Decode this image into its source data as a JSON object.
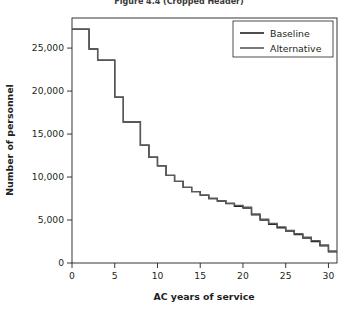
{
  "figure": {
    "title": "Figure 4.4 (Cropped Header)"
  },
  "chart_data": {
    "type": "line",
    "subtype": "step",
    "title": "",
    "xlabel": "AC years of service",
    "ylabel": "Number of personnel",
    "xlim": [
      0,
      31
    ],
    "ylim": [
      0,
      28500
    ],
    "xticks": [
      0,
      5,
      10,
      15,
      20,
      25,
      30
    ],
    "xticklabels": [
      "0",
      "5",
      "10",
      "15",
      "20",
      "25",
      "30"
    ],
    "yticks": [
      0,
      5000,
      10000,
      15000,
      20000,
      25000
    ],
    "yticklabels": [
      "0",
      "5,000",
      "10,000",
      "15,000",
      "20,000",
      "25,000"
    ],
    "grid": false,
    "legend_position": "top-right",
    "x": [
      0,
      1,
      2,
      3,
      4,
      5,
      6,
      7,
      8,
      9,
      10,
      11,
      12,
      13,
      14,
      15,
      16,
      17,
      18,
      19,
      20,
      21,
      22,
      23,
      24,
      25,
      26,
      27,
      28,
      29,
      30
    ],
    "series": [
      {
        "name": "Baseline",
        "color": "#231f20",
        "values": [
          27200,
          27200,
          24900,
          23600,
          23600,
          19300,
          16400,
          16400,
          13700,
          12300,
          11300,
          10200,
          9500,
          8800,
          8300,
          7900,
          7500,
          7200,
          6900,
          6600,
          6400,
          5600,
          5000,
          4500,
          4100,
          3700,
          3300,
          2900,
          2500,
          2000,
          1300
        ]
      },
      {
        "name": "Alternative",
        "color": "#58595b",
        "values": [
          27200,
          27200,
          24900,
          23600,
          23600,
          19300,
          16400,
          16400,
          13700,
          12300,
          11300,
          10200,
          9500,
          8800,
          8300,
          7900,
          7500,
          7250,
          6950,
          6700,
          6500,
          5700,
          5100,
          4600,
          4200,
          3800,
          3400,
          3000,
          2600,
          2100,
          1400
        ]
      }
    ],
    "legend": [
      {
        "label": "Baseline",
        "color": "#231f20"
      },
      {
        "label": "Alternative",
        "color": "#58595b"
      }
    ]
  }
}
